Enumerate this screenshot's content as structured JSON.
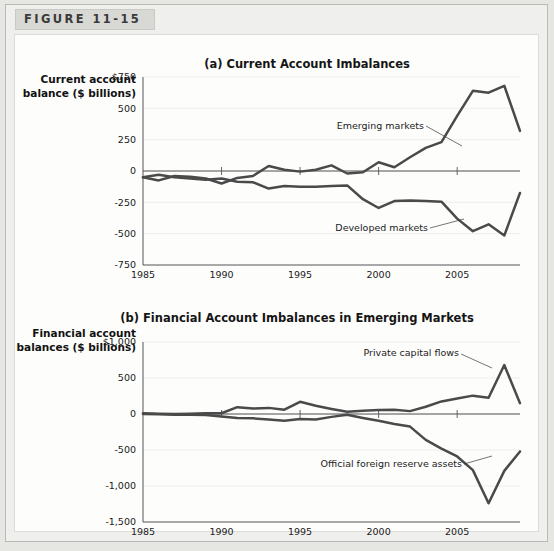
{
  "figure": {
    "tab_label": "FIGURE 11-15"
  },
  "chart_data": [
    {
      "type": "line",
      "title": "(a) Current Account Imbalances",
      "ylabel": "Current account balance ($ billions)",
      "xlabel": "",
      "ylim": [
        -750,
        750
      ],
      "xlim": [
        1985,
        2009
      ],
      "ytick_labels": [
        "$750",
        "500",
        "250",
        "0",
        "-250",
        "-500",
        "-750"
      ],
      "ytick_values": [
        750,
        500,
        250,
        0,
        -250,
        -500,
        -750
      ],
      "xtick_labels": [
        "1985",
        "1990",
        "1995",
        "2000",
        "2005"
      ],
      "xtick_values": [
        1985,
        1990,
        1995,
        2000,
        2005
      ],
      "grid": true,
      "legend": "annotations",
      "x": [
        1985,
        1986,
        1987,
        1988,
        1989,
        1990,
        1991,
        1992,
        1993,
        1994,
        1995,
        1996,
        1997,
        1998,
        1999,
        2000,
        2001,
        2002,
        2003,
        2004,
        2005,
        2006,
        2007,
        2008,
        2009
      ],
      "series": [
        {
          "name": "Emerging markets",
          "annotation": "Emerging markets",
          "values": [
            -50,
            -75,
            -40,
            -45,
            -60,
            -100,
            -55,
            -40,
            40,
            10,
            -5,
            10,
            45,
            -20,
            -10,
            70,
            30,
            110,
            185,
            230,
            440,
            640,
            625,
            680,
            320
          ]
        },
        {
          "name": "Developed markets",
          "annotation": "Developed markets",
          "values": [
            -50,
            -30,
            -50,
            -60,
            -70,
            -60,
            -85,
            -90,
            -140,
            -120,
            -125,
            -125,
            -120,
            -115,
            -225,
            -295,
            -240,
            -235,
            -240,
            -245,
            -380,
            -480,
            -425,
            -515,
            -175
          ]
        }
      ]
    },
    {
      "type": "line",
      "title": "(b) Financial Account Imbalances in Emerging Markets",
      "ylabel": "Financial account balances ($ billions)",
      "xlabel": "",
      "ylim": [
        -1500,
        1000
      ],
      "xlim": [
        1985,
        2009
      ],
      "ytick_labels": [
        "$1,000",
        "500",
        "0",
        "-500",
        "-1,000",
        "-1,500"
      ],
      "ytick_values": [
        1000,
        500,
        0,
        -500,
        -1000,
        -1500
      ],
      "xtick_labels": [
        "1985",
        "1990",
        "1995",
        "2000",
        "2005"
      ],
      "xtick_values": [
        1985,
        1990,
        1995,
        2000,
        2005
      ],
      "grid": true,
      "legend": "annotations",
      "x": [
        1985,
        1986,
        1987,
        1988,
        1989,
        1990,
        1991,
        1992,
        1993,
        1994,
        1995,
        1996,
        1997,
        1998,
        1999,
        2000,
        2001,
        2002,
        2003,
        2004,
        2005,
        2006,
        2007,
        2008,
        2009
      ],
      "series": [
        {
          "name": "Private capital flows",
          "annotation": "Private capital flows",
          "values": [
            10,
            5,
            0,
            5,
            10,
            10,
            95,
            75,
            85,
            60,
            170,
            115,
            70,
            30,
            45,
            55,
            60,
            40,
            100,
            175,
            215,
            255,
            225,
            680,
            150,
            210
          ]
        },
        {
          "name": "Official foreign reserve assets",
          "annotation": "Official foreign reserve assets",
          "values": [
            0,
            -5,
            -10,
            -10,
            -15,
            -35,
            -55,
            -60,
            -75,
            -95,
            -70,
            -75,
            -40,
            -10,
            -55,
            -95,
            -140,
            -175,
            -360,
            -480,
            -590,
            -780,
            -1240,
            -790,
            -520
          ]
        }
      ]
    }
  ]
}
